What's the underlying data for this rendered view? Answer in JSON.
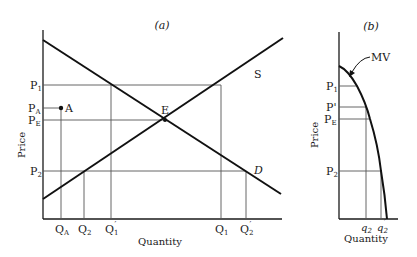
{
  "panels": {
    "a": {
      "title": "(a)",
      "y_label": "Price",
      "x_label": "Quantity",
      "curves": {
        "demand": {
          "label": "D"
        },
        "supply": {
          "label": "S"
        }
      },
      "equilibrium_label": "E",
      "point_a_label": "A",
      "price_ticks": {
        "p1": {
          "main": "P",
          "sub": "1"
        },
        "pa": {
          "main": "P",
          "sub": "A"
        },
        "pe": {
          "main": "P",
          "sub": "E"
        },
        "p2": {
          "main": "P",
          "sub": "2"
        }
      },
      "quantity_ticks": {
        "qa": {
          "main": "Q",
          "sub": "A",
          "sup": ""
        },
        "q2": {
          "main": "Q",
          "sub": "2",
          "sup": ""
        },
        "q1p": {
          "main": "Q",
          "sub": "1",
          "sup": "′"
        },
        "q1": {
          "main": "Q",
          "sub": "1",
          "sup": ""
        },
        "q2p": {
          "main": "Q",
          "sub": "2",
          "sup": "′"
        }
      }
    },
    "b": {
      "title": "(b)",
      "y_label": "Price",
      "x_label": "Quantity",
      "curve_label": "MV",
      "price_ticks": {
        "p1": {
          "main": "P",
          "sub": "1"
        },
        "pprime": {
          "main": "P'",
          "sub": ""
        },
        "pe": {
          "main": "P",
          "sub": "E"
        },
        "p2": {
          "main": "P",
          "sub": "2"
        }
      },
      "quantity_ticks": {
        "q2": {
          "main": "q",
          "sub": "2",
          "sup": ""
        },
        "q2p": {
          "main": "q",
          "sub": "2",
          "sup": "′"
        }
      }
    }
  }
}
